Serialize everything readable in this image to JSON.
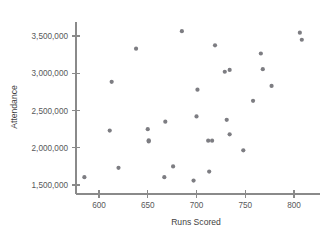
{
  "chart_data": {
    "type": "scatter",
    "title": "",
    "xlabel": "Runs Scored",
    "ylabel": "Attendance",
    "xlim": [
      575,
      815
    ],
    "ylim": [
      1450000,
      3650000
    ],
    "grid": false,
    "legend": "none",
    "marker_color": "#7d7d82",
    "axis_color": "#8a8a8a",
    "xticks": [
      600,
      650,
      700,
      750,
      800
    ],
    "xtick_labels": [
      "600",
      "650",
      "700",
      "750",
      "800"
    ],
    "yticks": [
      1500000,
      2000000,
      2500000,
      3000000,
      3500000
    ],
    "ytick_labels": [
      "1,500,000",
      "2,000,000",
      "2,500,000",
      "3,000,000",
      "3,500,000"
    ],
    "points": [
      {
        "x": 585,
        "y": 1605000
      },
      {
        "x": 611,
        "y": 2230000
      },
      {
        "x": 613,
        "y": 2885000
      },
      {
        "x": 620,
        "y": 1730000
      },
      {
        "x": 638,
        "y": 3330000
      },
      {
        "x": 650,
        "y": 2250000
      },
      {
        "x": 651,
        "y": 2100000
      },
      {
        "x": 651,
        "y": 2085000
      },
      {
        "x": 667,
        "y": 1605000
      },
      {
        "x": 668,
        "y": 2350000
      },
      {
        "x": 676,
        "y": 1750000
      },
      {
        "x": 685,
        "y": 3565000
      },
      {
        "x": 697,
        "y": 1560000
      },
      {
        "x": 700,
        "y": 2420000
      },
      {
        "x": 701,
        "y": 2780000
      },
      {
        "x": 712,
        "y": 2095000
      },
      {
        "x": 713,
        "y": 1680000
      },
      {
        "x": 716,
        "y": 2095000
      },
      {
        "x": 719,
        "y": 3375000
      },
      {
        "x": 729,
        "y": 3020000
      },
      {
        "x": 731,
        "y": 2375000
      },
      {
        "x": 734,
        "y": 3045000
      },
      {
        "x": 734,
        "y": 2180000
      },
      {
        "x": 748,
        "y": 1965000
      },
      {
        "x": 758,
        "y": 2630000
      },
      {
        "x": 766,
        "y": 3265000
      },
      {
        "x": 768,
        "y": 3055000
      },
      {
        "x": 777,
        "y": 2830000
      },
      {
        "x": 806,
        "y": 3545000
      },
      {
        "x": 808,
        "y": 3450000
      }
    ]
  }
}
